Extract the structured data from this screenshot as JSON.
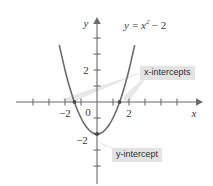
{
  "figure": {
    "background_color": "#ffffff",
    "curve_color": "#6b6b6b",
    "axis_color": "#6b6b6b",
    "text_color": "#3a3a3a",
    "callout_background": "#e3e3e3",
    "leader_color": "#e0e0e0"
  },
  "equation": {
    "lhs": "y",
    "equals": "=",
    "variable": "x",
    "exponent": "2",
    "minus": "−",
    "constant": "2",
    "plain": "y = x² − 2"
  },
  "axes": {
    "x_axis_label": "x",
    "y_axis_label": "y",
    "origin_label": "0",
    "x_tick_labels": [
      "−2",
      "2"
    ],
    "y_tick_labels": [
      "2",
      "−2"
    ]
  },
  "callouts": {
    "x_intercepts": "x-intercepts",
    "y_intercept": "y-intercept"
  },
  "chart_data": {
    "type": "line",
    "xlabel": "x",
    "ylabel": "y",
    "xlim": [
      -3.6,
      3.6
    ],
    "ylim": [
      -3.6,
      3.6
    ],
    "grid": false,
    "legend": "none",
    "series": [
      {
        "name": "y = x² − 2",
        "equation": "y = x^2 - 2",
        "color": "#6b6b6b",
        "x": [
          -2.35,
          -2.0,
          -1.75,
          -1.5,
          -1.25,
          -1.0,
          -0.75,
          -0.5,
          -0.25,
          0,
          0.25,
          0.5,
          0.75,
          1.0,
          1.25,
          1.5,
          1.75,
          2.0,
          2.35
        ],
        "y": [
          3.52,
          2.0,
          1.06,
          0.25,
          -0.44,
          -1.0,
          -1.44,
          -1.75,
          -1.94,
          -2.0,
          -1.94,
          -1.75,
          -1.44,
          -1.0,
          -0.44,
          0.25,
          1.06,
          2.0,
          3.52
        ]
      }
    ],
    "points": [
      {
        "label": "x-intercept",
        "x": -1.41,
        "y": 0
      },
      {
        "label": "x-intercept",
        "x": 1.41,
        "y": 0
      },
      {
        "label": "y-intercept",
        "x": 0,
        "y": -2
      }
    ],
    "annotations": [
      {
        "text": "y = x² − 2",
        "x": 2.4,
        "y": 3.3
      },
      {
        "text": "x-intercepts",
        "x": 2.3,
        "y": 1.35
      },
      {
        "text": "y-intercept",
        "x": 1.1,
        "y": -2.4
      }
    ],
    "x_ticks": [
      -3,
      -2.5,
      -2,
      -1.5,
      -1,
      -0.5,
      0.5,
      1,
      1.5,
      2,
      2.5,
      3
    ],
    "y_ticks": [
      -3,
      -2.5,
      -2,
      -1.5,
      -1,
      -0.5,
      0.5,
      1,
      1.5,
      2,
      2.5,
      3
    ],
    "x_labeled_ticks": [
      {
        "value": -2,
        "label": "−2"
      },
      {
        "value": 2,
        "label": "2"
      }
    ],
    "y_labeled_ticks": [
      {
        "value": 2,
        "label": "2"
      },
      {
        "value": -2,
        "label": "−2"
      }
    ]
  }
}
